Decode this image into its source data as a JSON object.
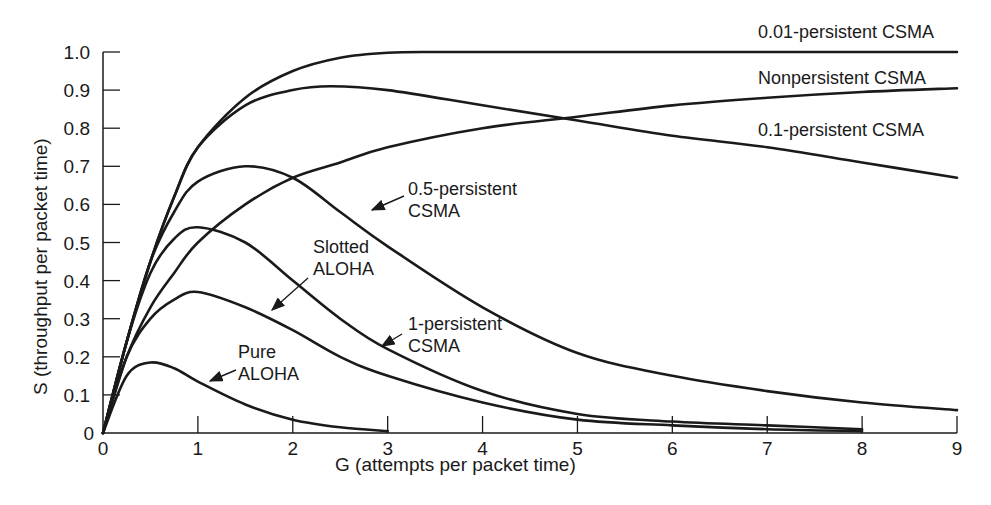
{
  "chart_data": {
    "type": "line",
    "title": "",
    "xlabel": "G (attempts per packet time)",
    "ylabel": "S (throughput per packet time)",
    "xlim": [
      0,
      9
    ],
    "ylim": [
      0,
      1.0
    ],
    "grid": false,
    "legend": "inline labels",
    "x_ticks": [
      "0",
      "1",
      "2",
      "3",
      "4",
      "5",
      "6",
      "7",
      "8",
      "9"
    ],
    "y_ticks": [
      "0",
      "0.1",
      "0.2",
      "0.3",
      "0.4",
      "0.5",
      "0.6",
      "0.7",
      "0.8",
      "0.9",
      "1.0"
    ],
    "series": [
      {
        "name": "0.01-persistent CSMA",
        "x": [
          0,
          0.25,
          0.5,
          0.75,
          1,
          1.5,
          2,
          2.5,
          3,
          3.5,
          4,
          5,
          6,
          7,
          8,
          9
        ],
        "y": [
          0,
          0.24,
          0.45,
          0.62,
          0.75,
          0.88,
          0.95,
          0.985,
          0.998,
          1.0,
          1.0,
          1.0,
          1.0,
          1.0,
          1.0,
          1.0
        ]
      },
      {
        "name": "Nonpersistent CSMA",
        "x": [
          0,
          0.25,
          0.5,
          0.75,
          1,
          1.5,
          2,
          2.5,
          3,
          4,
          5,
          6,
          7,
          8,
          9
        ],
        "y": [
          0,
          0.2,
          0.33,
          0.42,
          0.5,
          0.6,
          0.67,
          0.71,
          0.75,
          0.8,
          0.83,
          0.86,
          0.88,
          0.895,
          0.905
        ]
      },
      {
        "name": "0.1-persistent CSMA",
        "x": [
          0,
          0.25,
          0.5,
          0.75,
          1,
          1.5,
          2,
          2.4,
          3,
          4,
          5,
          6,
          7,
          8,
          9
        ],
        "y": [
          0,
          0.24,
          0.45,
          0.62,
          0.75,
          0.86,
          0.9,
          0.91,
          0.9,
          0.86,
          0.82,
          0.78,
          0.75,
          0.71,
          0.67
        ]
      },
      {
        "name": "0.5-persistent CSMA",
        "x": [
          0,
          0.25,
          0.5,
          0.75,
          1,
          1.5,
          2,
          2.5,
          3,
          4,
          5,
          6,
          7,
          8,
          9
        ],
        "y": [
          0,
          0.24,
          0.45,
          0.58,
          0.66,
          0.7,
          0.67,
          0.58,
          0.49,
          0.33,
          0.21,
          0.15,
          0.11,
          0.08,
          0.06
        ]
      },
      {
        "name": "1-persistent CSMA",
        "x": [
          0,
          0.25,
          0.5,
          0.75,
          1,
          1.5,
          2,
          2.5,
          3,
          4,
          5,
          6,
          7,
          8
        ],
        "y": [
          0,
          0.24,
          0.42,
          0.51,
          0.54,
          0.5,
          0.4,
          0.3,
          0.22,
          0.11,
          0.05,
          0.03,
          0.02,
          0.01
        ]
      },
      {
        "name": "Slotted ALOHA",
        "x": [
          0,
          0.25,
          0.5,
          0.75,
          1,
          1.5,
          2,
          2.5,
          3,
          4,
          5,
          6,
          7,
          8
        ],
        "y": [
          0,
          0.2,
          0.3,
          0.35,
          0.37,
          0.33,
          0.27,
          0.2,
          0.15,
          0.08,
          0.035,
          0.02,
          0.01,
          0.005
        ]
      },
      {
        "name": "Pure ALOHA",
        "x": [
          0,
          0.25,
          0.5,
          0.75,
          1,
          1.5,
          2,
          2.5,
          3
        ],
        "y": [
          0,
          0.15,
          0.185,
          0.17,
          0.135,
          0.075,
          0.035,
          0.015,
          0.005
        ]
      }
    ],
    "annotations": [
      {
        "text": [
          "0.01-persistent CSMA"
        ],
        "series": "0.01-persistent CSMA",
        "arrow": false
      },
      {
        "text": [
          "Nonpersistent CSMA"
        ],
        "series": "Nonpersistent CSMA",
        "arrow": false
      },
      {
        "text": [
          "0.1-persistent CSMA"
        ],
        "series": "0.1-persistent CSMA",
        "arrow": false
      },
      {
        "text": [
          "0.5-persistent",
          "CSMA"
        ],
        "series": "0.5-persistent CSMA",
        "arrow": true
      },
      {
        "text": [
          "Slotted",
          "ALOHA"
        ],
        "series": "Slotted ALOHA",
        "arrow": true
      },
      {
        "text": [
          "1-persistent",
          "CSMA"
        ],
        "series": "1-persistent CSMA",
        "arrow": true
      },
      {
        "text": [
          "Pure",
          "ALOHA"
        ],
        "series": "Pure ALOHA",
        "arrow": true
      }
    ]
  },
  "colors": {
    "line": "#1a1a1a",
    "background": "#ffffff"
  }
}
